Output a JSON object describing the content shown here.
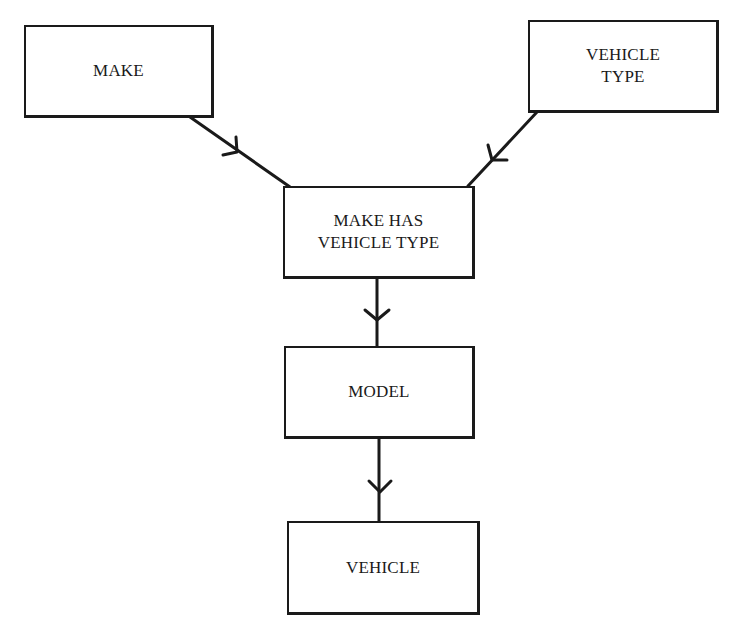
{
  "diagram": {
    "type": "entity-relationship",
    "entities": [
      {
        "id": "make",
        "lines": [
          "MAKE"
        ]
      },
      {
        "id": "vehicle_type",
        "lines": [
          "VEHICLE",
          "TYPE"
        ]
      },
      {
        "id": "make_has_vehicle_type",
        "lines": [
          "MAKE HAS",
          "VEHICLE TYPE"
        ]
      },
      {
        "id": "model",
        "lines": [
          "MODEL"
        ]
      },
      {
        "id": "vehicle",
        "lines": [
          "VEHICLE"
        ]
      }
    ],
    "relationships": [
      {
        "from": "MAKE",
        "to": "MAKE HAS VEHICLE TYPE",
        "arrow": "chevron"
      },
      {
        "from": "VEHICLE TYPE",
        "to": "MAKE HAS VEHICLE TYPE",
        "arrow": "chevron"
      },
      {
        "from": "MAKE HAS VEHICLE TYPE",
        "to": "MODEL",
        "arrow": "chevron"
      },
      {
        "from": "MODEL",
        "to": "VEHICLE",
        "arrow": "chevron"
      }
    ],
    "colors": {
      "line": "#1a1a1a",
      "background": "#ffffff"
    }
  }
}
